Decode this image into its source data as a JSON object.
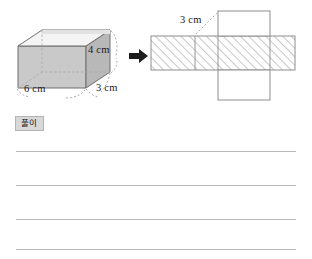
{
  "page": {
    "background_color": "#ffffff",
    "width": 312,
    "height": 259
  },
  "figure": {
    "solid": {
      "name": "open-top-rectangular-prism",
      "description": "shaded open-top rectangular box drawn in oblique projection",
      "face_fill_color": "#c9c9c9",
      "top_fill_color": "#f2f2f2",
      "edge_color": "#6e6e6e",
      "dimensions": [
        {
          "id": "height",
          "value": "4 cm"
        },
        {
          "id": "width",
          "value": "6 cm"
        },
        {
          "id": "depth",
          "value": "3 cm"
        }
      ]
    },
    "arrow": {
      "name": "right-arrow",
      "glyph": "➡",
      "color": "#1c1c1c"
    },
    "net": {
      "name": "box-net",
      "description": "cross-shaped net: horizontal hatched band of four rectangles with one plain square flap above and one below",
      "hatch_color": "#9a9a9a",
      "outline_color": "#8d8d8d",
      "flap_fill_color": "#ffffff",
      "label": "3 cm"
    }
  },
  "solution": {
    "badge_label": "풀이",
    "badge_background": "#d8d8d8",
    "badge_border": "#b4b4b4",
    "line_count": 4,
    "line_color": "#b9b9b9",
    "lines": [
      "",
      "",
      "",
      ""
    ]
  }
}
